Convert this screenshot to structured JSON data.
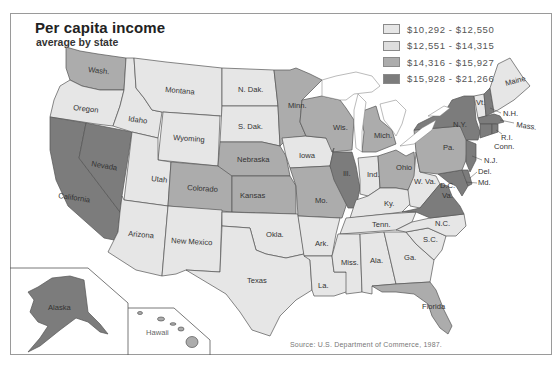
{
  "header": {
    "title": "Per capita income",
    "subtitle": "average by state"
  },
  "legend": {
    "items": [
      {
        "label": "$10,292 - $12,550",
        "color": "#e6e6e6",
        "bracket": 1
      },
      {
        "label": "$12,551 - $14,315",
        "color": "#dedede",
        "bracket": 2
      },
      {
        "label": "$14,316 - $15,927",
        "color": "#acacac",
        "bracket": 3
      },
      {
        "label": "$15,928 - $21,266",
        "color": "#7c7c7c",
        "bracket": 4
      }
    ]
  },
  "source": "Source: U.S. Department of Commerce, 1987.",
  "insets": {
    "alaska": {
      "label": "Alaska",
      "bracket": 4
    },
    "hawaii": {
      "label": "Hawaii",
      "bracket": 3
    }
  },
  "states": {
    "wash": {
      "label": "Wash.",
      "bracket": 3
    },
    "oregon": {
      "label": "Oregon",
      "bracket": 1
    },
    "california": {
      "label": "California",
      "bracket": 4
    },
    "nevada": {
      "label": "Nevada",
      "bracket": 4
    },
    "idaho": {
      "label": "Idaho",
      "bracket": 1
    },
    "montana": {
      "label": "Montana",
      "bracket": 1
    },
    "wyoming": {
      "label": "Wyoming",
      "bracket": 1
    },
    "utah": {
      "label": "Utah",
      "bracket": 1
    },
    "arizona": {
      "label": "Arizona",
      "bracket": 1
    },
    "colorado": {
      "label": "Colorado",
      "bracket": 3
    },
    "new_mexico": {
      "label": "New Mexico",
      "bracket": 1
    },
    "n_dak": {
      "label": "N. Dak.",
      "bracket": 1
    },
    "s_dak": {
      "label": "S. Dak.",
      "bracket": 1
    },
    "nebraska": {
      "label": "Nebraska",
      "bracket": 3
    },
    "kansas": {
      "label": "Kansas",
      "bracket": 3
    },
    "okla": {
      "label": "Okla.",
      "bracket": 1
    },
    "texas": {
      "label": "Texas",
      "bracket": 1
    },
    "minn": {
      "label": "Minn.",
      "bracket": 3
    },
    "iowa": {
      "label": "Iowa",
      "bracket": 1
    },
    "mo": {
      "label": "Mo.",
      "bracket": 3
    },
    "ark": {
      "label": "Ark.",
      "bracket": 1
    },
    "la": {
      "label": "La.",
      "bracket": 1
    },
    "wis": {
      "label": "Wis.",
      "bracket": 3
    },
    "ill": {
      "label": "Ill.",
      "bracket": 4
    },
    "mich": {
      "label": "Mich.",
      "bracket": 3
    },
    "ind": {
      "label": "Ind.",
      "bracket": 1
    },
    "ohio": {
      "label": "Ohio",
      "bracket": 3
    },
    "ky": {
      "label": "Ky.",
      "bracket": 1
    },
    "tenn": {
      "label": "Tenn.",
      "bracket": 1
    },
    "miss": {
      "label": "Miss.",
      "bracket": 1
    },
    "ala": {
      "label": "Ala.",
      "bracket": 1
    },
    "ga": {
      "label": "Ga.",
      "bracket": 1
    },
    "florida": {
      "label": "Florida",
      "bracket": 3
    },
    "s_c": {
      "label": "S.C.",
      "bracket": 1
    },
    "n_c": {
      "label": "N.C.",
      "bracket": 1
    },
    "w_va": {
      "label": "W. Va.",
      "bracket": 1
    },
    "va": {
      "label": "Va.",
      "bracket": 4
    },
    "d_c": {
      "label": "D.C.",
      "bracket": 4
    },
    "md": {
      "label": "Md.",
      "bracket": 4
    },
    "del": {
      "label": "Del.",
      "bracket": 4
    },
    "n_j": {
      "label": "N.J.",
      "bracket": 4
    },
    "pa": {
      "label": "Pa.",
      "bracket": 3
    },
    "n_y": {
      "label": "N.Y.",
      "bracket": 4
    },
    "vt": {
      "label": "Vt.",
      "bracket": 1
    },
    "n_h": {
      "label": "N.H.",
      "bracket": 4
    },
    "maine": {
      "label": "Maine",
      "bracket": 1
    },
    "mass": {
      "label": "Mass.",
      "bracket": 4
    },
    "r_i": {
      "label": "R.I.",
      "bracket": 4
    },
    "conn": {
      "label": "Conn.",
      "bracket": 4
    }
  }
}
